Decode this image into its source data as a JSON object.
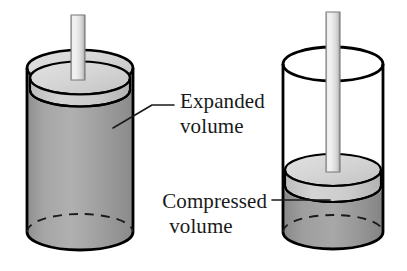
{
  "figure": {
    "background_color": "#ffffff",
    "width": 407,
    "height": 271
  },
  "labels": {
    "expanded": {
      "line1": "Expanded",
      "line2": "volume",
      "text": "Expanded volume",
      "leader": "diagonal-then-horizontal",
      "points_to": "left-cylinder-body"
    },
    "compressed": {
      "line1": "Compressed",
      "line2": "volume",
      "text": "Compressed volume",
      "leader": "horizontal",
      "points_to": "right-cylinder-compressed-region"
    }
  },
  "cylinders": [
    {
      "id": "left",
      "state": "expanded",
      "piston_position": "near-top",
      "material_fill": "full",
      "body_color": "#9b9b9b",
      "piston_color": "#c8c8c8",
      "top_face_color": "#d2d2d2",
      "outline_color": "#000000"
    },
    {
      "id": "right",
      "state": "compressed",
      "piston_position": "low",
      "material_fill": "bottom-only",
      "body_color": "#ffffff",
      "compressed_color": "#8f8f8f",
      "piston_color": "#c8c8c8",
      "outline_color": "#000000"
    }
  ],
  "colors": {
    "outline": "#000000",
    "material_gray": "#9b9b9b",
    "compressed_gray": "#8f8f8f",
    "piston_gray": "#c8c8c8",
    "rod_light": "#ededed",
    "rod_shade": "#bdbdbd",
    "text": "#1a1a1a",
    "background": "#ffffff"
  }
}
